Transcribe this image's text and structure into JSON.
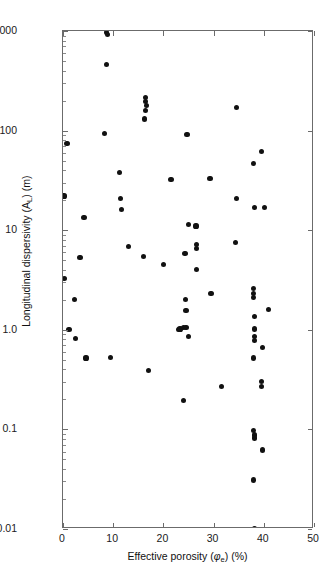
{
  "chart_data": {
    "type": "scatter",
    "title": "",
    "xlabel": "Effective porosity (φₑ) (%)",
    "ylabel": "Longitudinal dispersivity (Aʟ) (m)",
    "xlabel_parts": {
      "pre": "Effective porosity (",
      "sym": "φ",
      "sub": "e",
      "post": ") (%)"
    },
    "ylabel_parts": {
      "pre": "Longitudinal dispersivity (A",
      "sub": "L",
      "post": ") (m)"
    },
    "xscale": "linear",
    "yscale": "log",
    "xlim": [
      0,
      50
    ],
    "ylim": [
      0.01,
      1000
    ],
    "grid": false,
    "legend": null,
    "marker": "filled-circle",
    "marker_color": "#111111",
    "frame_color": "#6b6b6b",
    "background": "#ffffff",
    "xticks": [
      0,
      10,
      20,
      30,
      40,
      50
    ],
    "xticklabels": [
      "0",
      "10",
      "20",
      "30",
      "40",
      "50"
    ],
    "yticks": [
      0.01,
      0.1,
      1.0,
      10,
      100,
      1000
    ],
    "yticklabels": [
      "0.01",
      "0.1",
      "1.0",
      "10",
      "100",
      "1000"
    ],
    "n_points": 72,
    "points": [
      [
        8.6,
        960
      ],
      [
        8.8,
        920
      ],
      [
        8.6,
        460
      ],
      [
        16.5,
        215
      ],
      [
        16.5,
        195
      ],
      [
        16.6,
        178
      ],
      [
        16.4,
        160
      ],
      [
        16.3,
        131
      ],
      [
        34.5,
        172
      ],
      [
        0.8,
        74
      ],
      [
        8.3,
        93
      ],
      [
        24.7,
        91
      ],
      [
        39.5,
        62
      ],
      [
        38.0,
        47
      ],
      [
        11.2,
        38
      ],
      [
        21.5,
        32
      ],
      [
        29.3,
        33
      ],
      [
        0.2,
        22
      ],
      [
        11.5,
        21
      ],
      [
        34.5,
        21
      ],
      [
        4.2,
        13.5
      ],
      [
        11.6,
        16
      ],
      [
        38.2,
        17
      ],
      [
        40.2,
        17
      ],
      [
        25.0,
        11.5
      ],
      [
        26.5,
        11.0
      ],
      [
        34.4,
        7.5
      ],
      [
        26.6,
        7.2
      ],
      [
        26.6,
        6.6
      ],
      [
        16.1,
        5.4
      ],
      [
        13.0,
        6.8
      ],
      [
        3.4,
        5.3
      ],
      [
        24.3,
        5.8
      ],
      [
        20.0,
        4.5
      ],
      [
        26.6,
        4.0
      ],
      [
        0.3,
        3.3
      ],
      [
        38.0,
        2.6
      ],
      [
        38.0,
        2.3
      ],
      [
        38.0,
        2.1
      ],
      [
        29.5,
        2.3
      ],
      [
        24.4,
        2.0
      ],
      [
        2.3,
        2.0
      ],
      [
        24.5,
        1.55
      ],
      [
        41.0,
        1.6
      ],
      [
        38.1,
        1.35
      ],
      [
        1.2,
        1.0
      ],
      [
        23.1,
        1.0
      ],
      [
        23.3,
        1.02
      ],
      [
        24.0,
        1.05
      ],
      [
        24.5,
        1.05
      ],
      [
        38.1,
        1.02
      ],
      [
        2.5,
        0.82
      ],
      [
        25.0,
        0.85
      ],
      [
        38.1,
        0.86
      ],
      [
        38.1,
        0.78
      ],
      [
        39.7,
        0.66
      ],
      [
        4.6,
        0.52
      ],
      [
        9.5,
        0.53
      ],
      [
        38.0,
        0.52
      ],
      [
        17.0,
        0.39
      ],
      [
        31.5,
        0.27
      ],
      [
        39.6,
        0.3
      ],
      [
        39.6,
        0.27
      ],
      [
        24.0,
        0.195
      ],
      [
        38.0,
        0.098
      ],
      [
        38.1,
        0.088
      ],
      [
        38.1,
        0.082
      ],
      [
        39.7,
        0.062
      ],
      [
        38.0,
        0.031
      ],
      [
        38.2,
        0.0101
      ]
    ]
  }
}
